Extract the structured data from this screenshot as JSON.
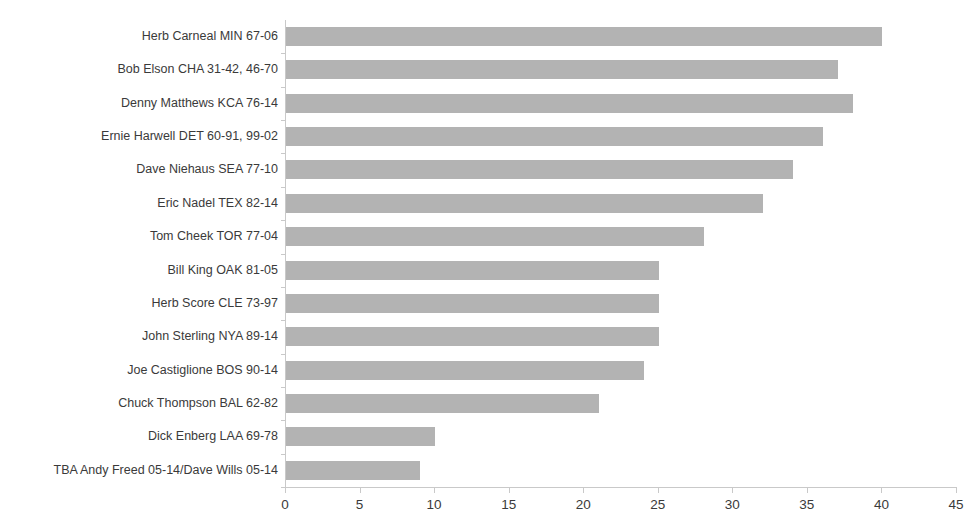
{
  "chart_data": {
    "type": "bar",
    "orientation": "horizontal",
    "title": "",
    "xlabel": "",
    "ylabel": "",
    "xlim": [
      0,
      45
    ],
    "xticks": [
      0,
      5,
      10,
      15,
      20,
      25,
      30,
      35,
      40,
      45
    ],
    "grid": false,
    "legend": false,
    "bar_color": "#b3b3b3",
    "categories": [
      "Herb Carneal MIN 67-06",
      "Bob Elson CHA 31-42, 46-70",
      "Denny Matthews KCA 76-14",
      "Ernie Harwell DET 60-91, 99-02",
      "Dave Niehaus SEA 77-10",
      "Eric Nadel TEX 82-14",
      "Tom Cheek TOR 77-04",
      "Bill King OAK 81-05",
      "Herb Score CLE 73-97",
      "John Sterling NYA 89-14",
      "Joe Castiglione BOS 90-14",
      "Chuck Thompson BAL 62-82",
      "Dick Enberg LAA 69-78",
      "TBA Andy Freed 05-14/Dave Wills 05-14"
    ],
    "values": [
      40,
      37,
      38,
      36,
      34,
      32,
      28,
      25,
      25,
      25,
      24,
      21,
      10,
      9
    ]
  },
  "axis": {
    "tick_labels": [
      "0",
      "5",
      "10",
      "15",
      "20",
      "25",
      "30",
      "35",
      "40",
      "45"
    ]
  }
}
